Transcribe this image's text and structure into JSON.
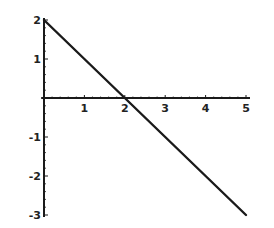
{
  "chart_data": {
    "type": "line",
    "title": "",
    "xlabel": "",
    "ylabel": "",
    "xlim": [
      0,
      5
    ],
    "ylim": [
      -3,
      2
    ],
    "grid": false,
    "legend": null,
    "x_ticks": [
      "1",
      "2",
      "3",
      "4",
      "5"
    ],
    "y_ticks": [
      "2",
      "1",
      "-1",
      "-2",
      "-3"
    ],
    "series": [
      {
        "name": "y = 2 - x",
        "x": [
          0,
          1,
          2,
          3,
          4,
          5
        ],
        "y": [
          2,
          1,
          0,
          -1,
          -2,
          -3
        ]
      }
    ],
    "colors": {
      "line": "#1a1a1a",
      "axis": "#1a1a1a",
      "background": "#ffffff"
    }
  }
}
